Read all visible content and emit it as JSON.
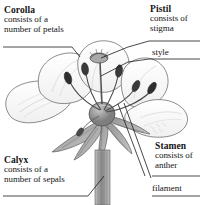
{
  "diagram": {
    "background_color": "#ffffff",
    "ink_color": "#3d3d3d",
    "text_color": "#141414"
  },
  "annotations": {
    "corolla": {
      "title": "Corolla",
      "line1": "consists of a",
      "line2": "number of petals"
    },
    "pistil": {
      "title": "Pistil",
      "line1": "consists of",
      "line2": "stigma"
    },
    "calyx": {
      "title": "Calyx",
      "line1": "consists of a",
      "line2": "number of sepals"
    },
    "stamen": {
      "title": "Stamen",
      "line1": "consists of",
      "line2": "anther"
    },
    "style": {
      "label": "style"
    },
    "filament": {
      "label": "filament"
    }
  }
}
